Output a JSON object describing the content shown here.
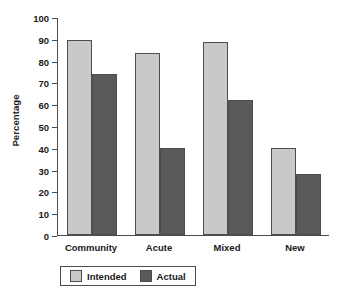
{
  "chart_data": {
    "type": "bar",
    "title": "",
    "xlabel": "",
    "ylabel": "Percentage",
    "categories": [
      "Community",
      "Acute",
      "Mixed",
      "New"
    ],
    "series": [
      {
        "name": "Intended",
        "color": "#c9c9c9",
        "values": [
          90,
          84,
          89,
          40
        ]
      },
      {
        "name": "Actual",
        "color": "#5a5a5a",
        "values": [
          74,
          40,
          62,
          28
        ]
      }
    ],
    "ylim": [
      0,
      100
    ],
    "ytick_step": 10,
    "yticks": [
      0,
      10,
      20,
      30,
      40,
      50,
      60,
      70,
      80,
      90,
      100
    ],
    "ytick_labels": [
      "0",
      "10",
      "20",
      "30",
      "40",
      "50",
      "60",
      "70",
      "80",
      "90",
      "100"
    ],
    "grid": false,
    "legend_position": "bottom-center",
    "axis_color": "#4d4d4d",
    "background_color": "#ffffff"
  }
}
